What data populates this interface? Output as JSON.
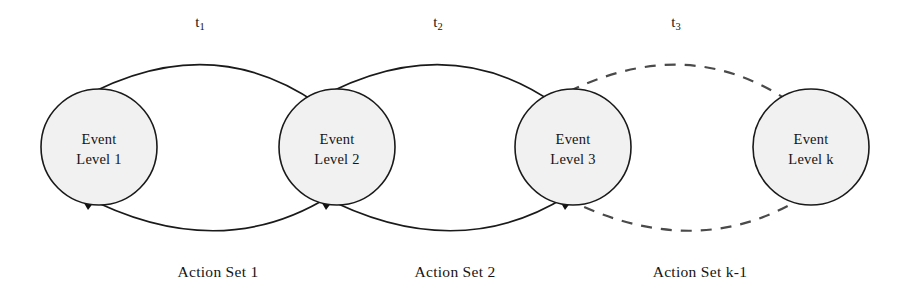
{
  "diagram": {
    "background_color": "#ffffff",
    "node_fill_color": "#f1f1f1",
    "node_stroke_color": "#1a1a1a",
    "edge_color": "#1a1a1a",
    "dashed_edge_color": "#4a4a4a"
  },
  "nodes": [
    {
      "id": "level1",
      "line1": "Event",
      "line2": "Level 1",
      "cx": 99,
      "cy": 147,
      "r": 58
    },
    {
      "id": "level2",
      "line1": "Event",
      "line2": "Level 2",
      "cx": 337,
      "cy": 147,
      "r": 58
    },
    {
      "id": "level3",
      "line1": "Event",
      "line2": "Level 3",
      "cx": 573,
      "cy": 147,
      "r": 58
    },
    {
      "id": "levelk",
      "line1": "Event",
      "line2": "Level k",
      "cx": 811,
      "cy": 147,
      "r": 58
    }
  ],
  "forward_edges": [
    {
      "id": "t1",
      "base": "t",
      "sub": "1",
      "style": "solid",
      "label_x": 200,
      "label_y": 27,
      "from": "level1",
      "to": "level2"
    },
    {
      "id": "t2",
      "base": "t",
      "sub": "2",
      "style": "solid",
      "label_x": 438,
      "label_y": 27,
      "from": "level2",
      "to": "level3"
    },
    {
      "id": "t3",
      "base": "t",
      "sub": "3",
      "style": "dashed",
      "label_x": 676,
      "label_y": 27,
      "from": "level3",
      "to": "levelk"
    }
  ],
  "return_edges": [
    {
      "id": "as1",
      "label": "Action Set 1",
      "style": "solid",
      "label_x": 218,
      "label_y": 277,
      "from": "level2",
      "to": "level1"
    },
    {
      "id": "as2",
      "label": "Action Set 2",
      "style": "solid",
      "label_x": 455,
      "label_y": 277,
      "from": "level3",
      "to": "level2"
    },
    {
      "id": "ask1",
      "label": "Action Set k-1",
      "style": "dashed",
      "label_x": 700,
      "label_y": 277,
      "from": "levelk",
      "to": "level3"
    }
  ]
}
